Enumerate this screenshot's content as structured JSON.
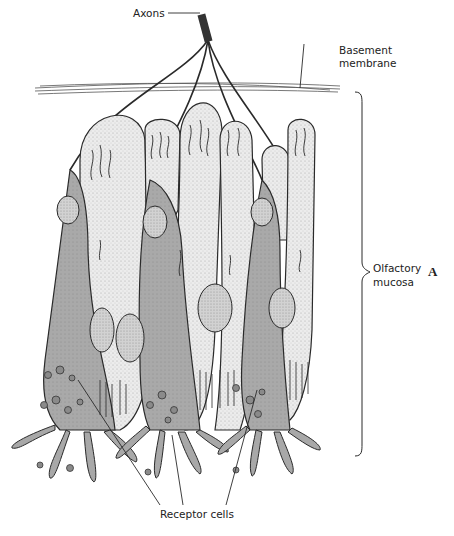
{
  "figure": {
    "panel_letter": "A"
  },
  "labels": {
    "axons": "Axons",
    "basement_membrane_line1": "Basement",
    "basement_membrane_line2": "membrane",
    "olfactory_mucosa_line1": "Olfactory",
    "olfactory_mucosa_line2": "mucosa",
    "receptor_cells": "Receptor cells"
  },
  "colors": {
    "background": "#ffffff",
    "outline": "#2a2a2a",
    "receptor_cell_fill": "#a8a8a8",
    "supporting_cell_fill": "#e6e6e6",
    "nucleus_fill": "#cfcfcf",
    "label_text": "#222222"
  }
}
